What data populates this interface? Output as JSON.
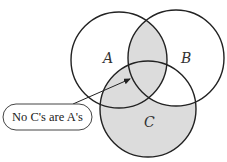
{
  "diagram": {
    "type": "venn",
    "sets": [
      {
        "id": "A",
        "label": "A",
        "cx": 119,
        "cy": 60,
        "r": 48,
        "label_x": 103,
        "label_y": 63
      },
      {
        "id": "B",
        "label": "B",
        "cx": 176,
        "cy": 58,
        "r": 48,
        "label_x": 181,
        "label_y": 63
      },
      {
        "id": "C",
        "label": "C",
        "cx": 148,
        "cy": 109,
        "r": 48,
        "label_x": 145,
        "label_y": 127
      }
    ],
    "shaded_regions": [
      "A∩B",
      "A∩C",
      "C only",
      "A∩B∩C"
    ],
    "unshaded_regions": [
      "A only",
      "B only",
      "B∩C only"
    ],
    "callout": {
      "text": "No C's are A's",
      "arrow_target": "A∩C"
    },
    "colors": {
      "stroke": "#222222",
      "shade": "#dcdcdc",
      "background": "#ffffff"
    }
  }
}
